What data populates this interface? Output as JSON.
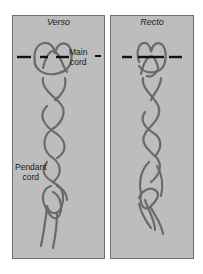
{
  "panels": [
    {
      "title": "Verso",
      "side": "left"
    },
    {
      "title": "Recto",
      "side": "right"
    }
  ],
  "labels": {
    "main_cord_line1": "Main",
    "main_cord_line2": "cord",
    "pendant_cord_line1": "Pendant",
    "pendant_cord_line2": "cord"
  },
  "colors": {
    "panel_bg": "#bdbdbd",
    "cord": "#6a6a6a",
    "main_cord": "#111111"
  }
}
